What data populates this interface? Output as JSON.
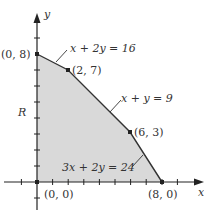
{
  "diagram": {
    "type": "feasible-region",
    "region_label": "R",
    "axes": {
      "x_label": "x",
      "y_label": "y"
    },
    "vertices": [
      {
        "label": "(0, 0)",
        "x": 0,
        "y": 0
      },
      {
        "label": "(0, 8)",
        "x": 0,
        "y": 8
      },
      {
        "label": "(2, 7)",
        "x": 2,
        "y": 7
      },
      {
        "label": "(6, 3)",
        "x": 6,
        "y": 3
      },
      {
        "label": "(8, 0)",
        "x": 8,
        "y": 0
      }
    ],
    "constraints": [
      {
        "label": "x + 2y = 16"
      },
      {
        "label": "x + y = 9"
      },
      {
        "label": "3x + 2y = 24"
      }
    ],
    "colors": {
      "region_fill": "#d9d9d9",
      "line": "#333333",
      "axis": "#222222"
    }
  }
}
